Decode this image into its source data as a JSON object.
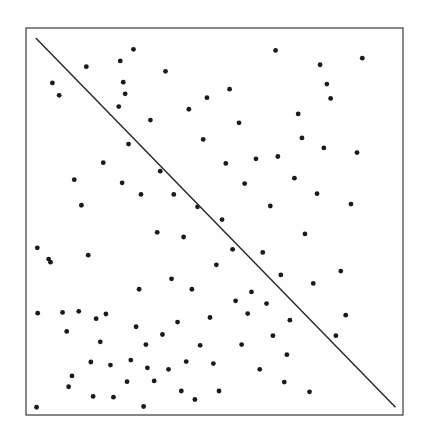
{
  "figure": {
    "kind": "scatter-plot-with-diagonal-line",
    "width": 427,
    "height": 439,
    "background_color": "#fefefe",
    "has_axis_labels": false,
    "has_tick_labels": false,
    "has_title": false,
    "has_legend": false
  },
  "frame": {
    "name": "plot-border-rectangle",
    "x": 26,
    "y": 28,
    "width": 377,
    "height": 387,
    "stroke_color": "#555555",
    "stroke_width": 1.4,
    "fill": "none"
  },
  "chart_data": {
    "type": "scatter",
    "title": "",
    "subtitle": "",
    "xlabel": "",
    "ylabel": "",
    "xlim": [
      0,
      1
    ],
    "ylim": [
      0,
      1
    ],
    "grid": false,
    "legend": "none",
    "axis_ticks": "none",
    "marker_color": "#1a1a1a",
    "marker_size_px": 2.4,
    "point_count": 101,
    "series": [
      {
        "name": "scatter-points",
        "marker": "filled-circle",
        "points": [
          [
            0.03,
            0.432
          ],
          [
            0.031,
            0.263
          ],
          [
            0.028,
            0.02
          ],
          [
            0.06,
            0.403
          ],
          [
            0.065,
            0.395
          ],
          [
            0.07,
            0.858
          ],
          [
            0.088,
            0.826
          ],
          [
            0.097,
            0.265
          ],
          [
            0.108,
            0.216
          ],
          [
            0.113,
            0.073
          ],
          [
            0.122,
            0.101
          ],
          [
            0.128,
            0.608
          ],
          [
            0.14,
            0.268
          ],
          [
            0.147,
            0.542
          ],
          [
            0.16,
            0.9
          ],
          [
            0.165,
            0.413
          ],
          [
            0.172,
            0.137
          ],
          [
            0.178,
            0.048
          ],
          [
            0.186,
            0.249
          ],
          [
            0.197,
            0.189
          ],
          [
            0.205,
            0.652
          ],
          [
            0.212,
            0.261
          ],
          [
            0.224,
            0.129
          ],
          [
            0.232,
            0.046
          ],
          [
            0.246,
            0.797
          ],
          [
            0.25,
            0.915
          ],
          [
            0.255,
            0.6
          ],
          [
            0.258,
            0.86
          ],
          [
            0.263,
            0.83
          ],
          [
            0.268,
            0.086
          ],
          [
            0.272,
            0.7
          ],
          [
            0.278,
            0.142
          ],
          [
            0.285,
            0.945
          ],
          [
            0.292,
            0.228
          ],
          [
            0.3,
            0.325
          ],
          [
            0.305,
            0.57
          ],
          [
            0.312,
            0.022
          ],
          [
            0.318,
            0.182
          ],
          [
            0.322,
            0.122
          ],
          [
            0.33,
            0.762
          ],
          [
            0.34,
            0.088
          ],
          [
            0.348,
            0.472
          ],
          [
            0.356,
            0.63
          ],
          [
            0.362,
            0.208
          ],
          [
            0.37,
            0.888
          ],
          [
            0.378,
            0.118
          ],
          [
            0.386,
            0.352
          ],
          [
            0.392,
            0.57
          ],
          [
            0.402,
            0.24
          ],
          [
            0.412,
            0.062
          ],
          [
            0.418,
            0.46
          ],
          [
            0.425,
            0.138
          ],
          [
            0.432,
            0.79
          ],
          [
            0.44,
            0.325
          ],
          [
            0.448,
            0.04
          ],
          [
            0.455,
            0.538
          ],
          [
            0.462,
            0.18
          ],
          [
            0.47,
            0.712
          ],
          [
            0.48,
            0.82
          ],
          [
            0.488,
            0.252
          ],
          [
            0.497,
            0.133
          ],
          [
            0.505,
            0.388
          ],
          [
            0.512,
            0.062
          ],
          [
            0.52,
            0.505
          ],
          [
            0.53,
            0.65
          ],
          [
            0.54,
            0.842
          ],
          [
            0.548,
            0.428
          ],
          [
            0.556,
            0.295
          ],
          [
            0.565,
            0.755
          ],
          [
            0.572,
            0.182
          ],
          [
            0.58,
            0.598
          ],
          [
            0.588,
            0.262
          ],
          [
            0.598,
            0.318
          ],
          [
            0.61,
            0.662
          ],
          [
            0.62,
            0.118
          ],
          [
            0.628,
            0.42
          ],
          [
            0.638,
            0.288
          ],
          [
            0.648,
            0.54
          ],
          [
            0.655,
            0.205
          ],
          [
            0.662,
            0.942
          ],
          [
            0.668,
            0.668
          ],
          [
            0.676,
            0.362
          ],
          [
            0.685,
            0.085
          ],
          [
            0.692,
            0.156
          ],
          [
            0.7,
            0.245
          ],
          [
            0.712,
            0.612
          ],
          [
            0.722,
            0.778
          ],
          [
            0.732,
            0.716
          ],
          [
            0.74,
            0.468
          ],
          [
            0.752,
            0.06
          ],
          [
            0.762,
            0.34
          ],
          [
            0.772,
            0.572
          ],
          [
            0.78,
            0.905
          ],
          [
            0.79,
            0.69
          ],
          [
            0.798,
            0.855
          ],
          [
            0.808,
            0.818
          ],
          [
            0.822,
            0.205
          ],
          [
            0.835,
            0.372
          ],
          [
            0.848,
            0.258
          ],
          [
            0.862,
            0.545
          ],
          [
            0.878,
            0.678
          ],
          [
            0.892,
            0.922
          ]
        ]
      }
    ],
    "reference_line": {
      "name": "diagonal-reference-line",
      "kind": "line",
      "from": [
        0.026,
        0.974
      ],
      "to": [
        0.98,
        0.02
      ],
      "slope": -1,
      "stroke_color": "#2b2b2b",
      "stroke_width": 1.5
    },
    "annotations": []
  }
}
